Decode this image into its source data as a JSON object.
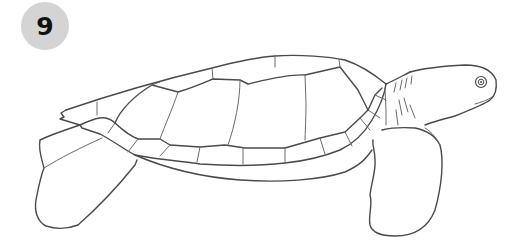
{
  "step": {
    "number": "9",
    "badge_color": "#d4d4d4",
    "number_color": "#111111"
  },
  "illustration": {
    "subject": "sea-turtle-line-drawing",
    "line_color": "#4a4a4a",
    "background": "#ffffff"
  }
}
